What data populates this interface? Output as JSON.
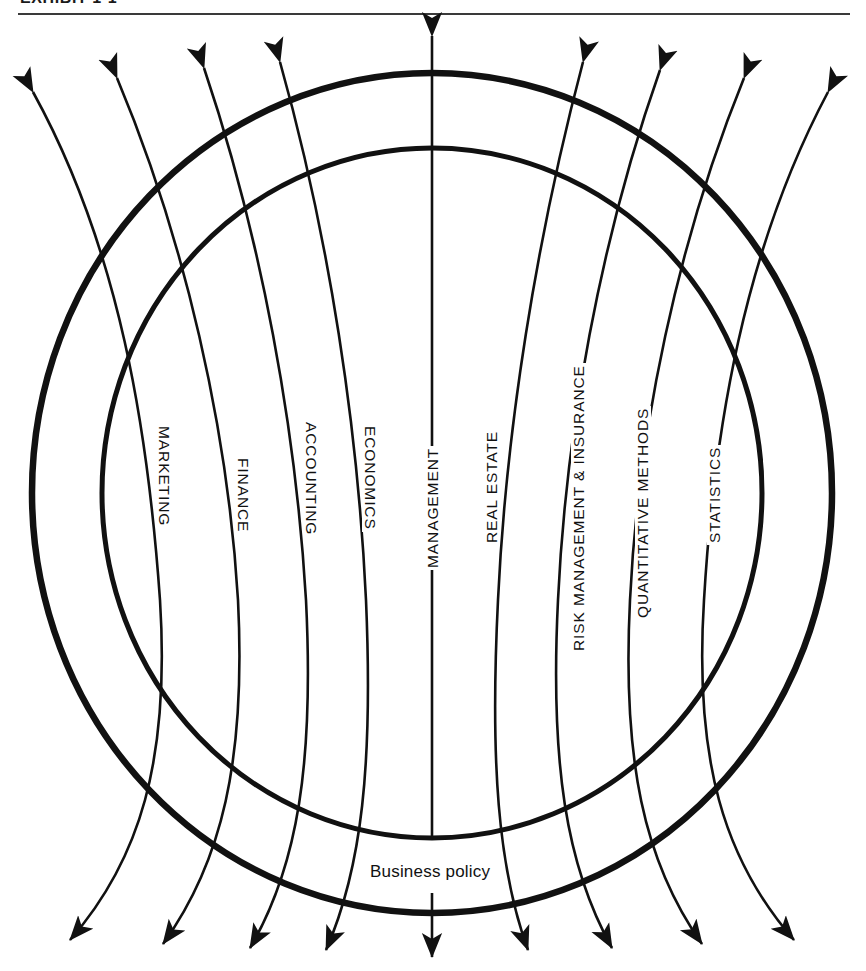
{
  "exhibit": {
    "header_label": "EXHIBIT 1-1"
  },
  "diagram": {
    "center_label": "Business policy",
    "colors": {
      "line": "#111111",
      "background": "#ffffff"
    },
    "spokes": [
      {
        "label": "MARKETING",
        "orientation": "cw"
      },
      {
        "label": "FINANCE",
        "orientation": "cw"
      },
      {
        "label": "ACCOUNTING",
        "orientation": "cw"
      },
      {
        "label": "ECONOMICS",
        "orientation": "cw"
      },
      {
        "label": "MANAGEMENT",
        "orientation": "ccw"
      },
      {
        "label": "REAL ESTATE",
        "orientation": "ccw"
      },
      {
        "label": "RISK MANAGEMENT & INSURANCE",
        "orientation": "ccw"
      },
      {
        "label": "QUANTITATIVE METHODS",
        "orientation": "ccw"
      },
      {
        "label": "STATISTICS",
        "orientation": "ccw"
      }
    ],
    "rings": [
      {
        "name": "outer-ring",
        "radius_x": 400,
        "radius_y": 420
      },
      {
        "name": "inner-ring",
        "radius_x": 330,
        "radius_y": 345
      }
    ],
    "center": {
      "x": 432,
      "y": 493
    }
  }
}
